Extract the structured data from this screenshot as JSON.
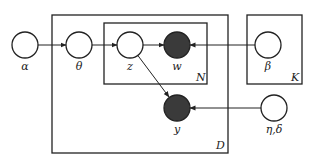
{
  "diagram": {
    "type": "plate-notation",
    "colors": {
      "stroke": "#222222",
      "observed_fill": "#3a3a3a",
      "latent_fill": "#ffffff",
      "background": "#ffffff"
    },
    "nodes": [
      {
        "id": "alpha",
        "label": "α",
        "observed": false
      },
      {
        "id": "theta",
        "label": "θ",
        "observed": false
      },
      {
        "id": "z",
        "label": "z",
        "observed": false
      },
      {
        "id": "w",
        "label": "w",
        "observed": true
      },
      {
        "id": "beta",
        "label": "β",
        "observed": false
      },
      {
        "id": "y",
        "label": "y",
        "observed": true
      },
      {
        "id": "eta_delta",
        "label": "η,δ",
        "observed": false
      }
    ],
    "plates": [
      {
        "id": "D",
        "label": "D"
      },
      {
        "id": "N",
        "label": "N"
      },
      {
        "id": "K",
        "label": "K"
      }
    ],
    "edges": [
      {
        "from": "alpha",
        "to": "theta"
      },
      {
        "from": "theta",
        "to": "z"
      },
      {
        "from": "z",
        "to": "w"
      },
      {
        "from": "beta",
        "to": "w"
      },
      {
        "from": "z",
        "to": "y"
      },
      {
        "from": "eta_delta",
        "to": "y"
      }
    ]
  }
}
